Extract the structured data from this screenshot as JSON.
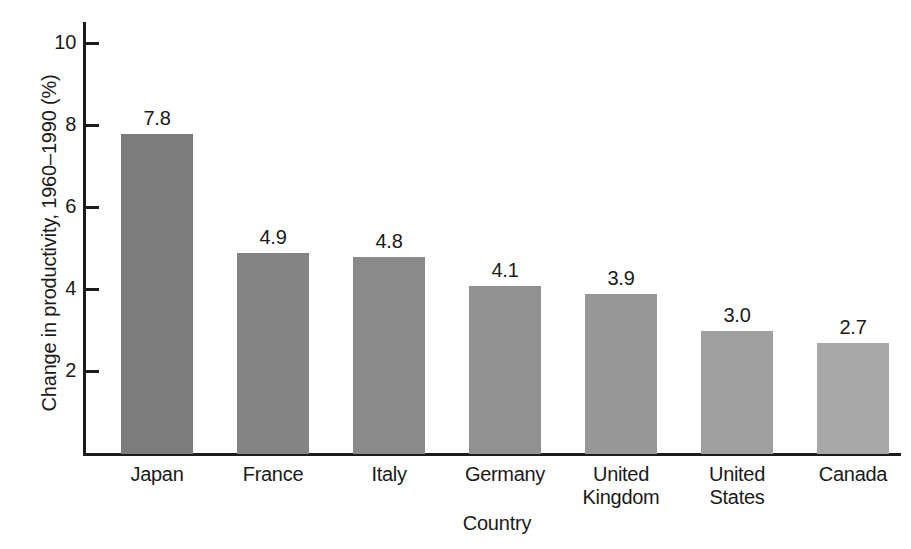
{
  "chart_data": {
    "type": "bar",
    "title": "",
    "xlabel": "Country",
    "ylabel": "Change in productivity, 1960–1990 (%)",
    "categories": [
      "Japan",
      "France",
      "Italy",
      "Germany",
      "United Kingdom",
      "United States",
      "Canada"
    ],
    "values": [
      7.8,
      4.9,
      4.8,
      4.1,
      3.9,
      3.0,
      2.7
    ],
    "value_labels": [
      "7.8",
      "4.9",
      "4.8",
      "4.1",
      "3.9",
      "3.0",
      "2.7"
    ],
    "category_lines": [
      [
        "Japan"
      ],
      [
        "France"
      ],
      [
        "Italy"
      ],
      [
        "Germany"
      ],
      [
        "United",
        "Kingdom"
      ],
      [
        "United",
        "States"
      ],
      [
        "Canada"
      ]
    ],
    "ylim": [
      0,
      10.6
    ],
    "yticks": [
      2,
      4,
      6,
      8,
      10
    ],
    "ytick_labels": [
      "2",
      "4",
      "6",
      "8",
      "10"
    ],
    "grid": false,
    "legend": null,
    "bar_colors": [
      "#7c7c7c",
      "#848484",
      "#8a8a8a",
      "#919191",
      "#979797",
      "#9f9f9f",
      "#a8a8a8"
    ],
    "axis_color": "#1c1c1c"
  }
}
